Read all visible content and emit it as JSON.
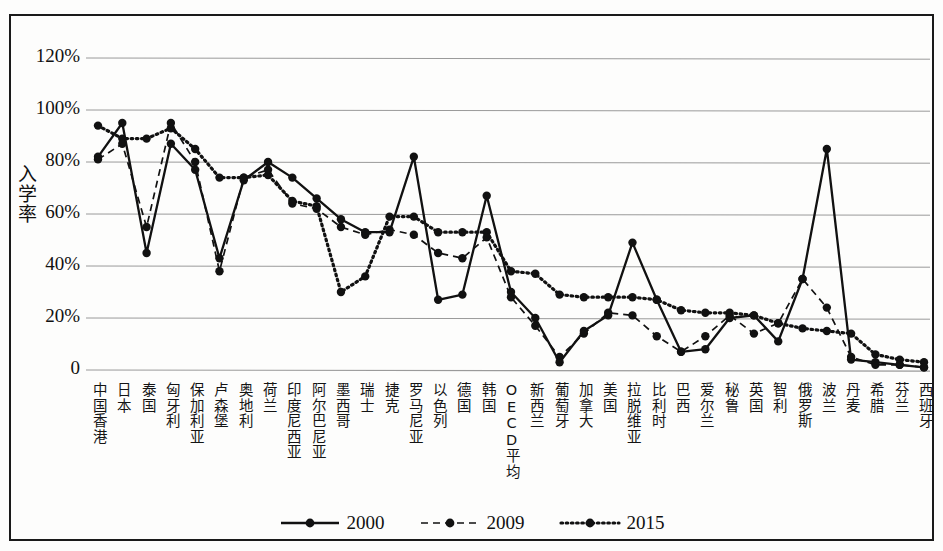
{
  "chart_data": {
    "type": "line",
    "title": "",
    "xlabel": "",
    "ylabel": "入学率",
    "ylim": [
      0,
      130
    ],
    "yticks": [
      0,
      20,
      40,
      60,
      80,
      100,
      120
    ],
    "ytick_labels": [
      "0",
      "20%",
      "40%",
      "60%",
      "80%",
      "100%",
      "120%"
    ],
    "grid": true,
    "legend_position": "bottom-center",
    "categories": [
      "中国香港",
      "日本",
      "泰国",
      "匈牙利",
      "保加利亚",
      "卢森堡",
      "奥地利",
      "荷兰",
      "印度尼西亚",
      "阿尔巴尼亚",
      "墨西哥",
      "瑞士",
      "捷克",
      "罗马尼亚",
      "以色列",
      "德国",
      "韩国",
      "OECD平均",
      "新西兰",
      "葡萄牙",
      "加拿大",
      "美国",
      "拉脱维亚",
      "比利时",
      "巴西",
      "爱尔兰",
      "秘鲁",
      "英国",
      "智利",
      "俄罗斯",
      "波兰",
      "丹麦",
      "希腊",
      "芬兰",
      "西班牙"
    ],
    "series": [
      {
        "name": "2000",
        "style": "solid",
        "values": [
          82,
          95,
          45,
          87,
          77,
          43,
          73,
          80,
          74,
          66,
          58,
          53,
          53,
          82,
          27,
          29,
          67,
          30,
          20,
          3,
          15,
          21,
          49,
          27,
          7,
          8,
          20,
          21,
          11,
          35,
          85,
          4,
          3,
          2,
          1
        ]
      },
      {
        "name": "2009",
        "style": "dashed",
        "values": [
          81,
          87,
          55,
          95,
          80,
          38,
          74,
          77,
          64,
          62,
          55,
          52,
          54,
          52,
          45,
          43,
          51,
          28,
          17,
          5,
          14,
          22,
          21,
          13,
          7,
          13,
          21,
          14,
          18,
          35,
          24,
          5,
          2,
          2,
          1
        ]
      },
      {
        "name": "2015",
        "style": "dotted",
        "values": [
          94,
          89,
          89,
          93,
          85,
          74,
          74,
          75,
          65,
          63,
          30,
          36,
          59,
          59,
          53,
          53,
          53,
          38,
          37,
          29,
          28,
          28,
          28,
          27,
          23,
          22,
          22,
          21,
          18,
          16,
          15,
          14,
          6,
          4,
          3
        ]
      }
    ],
    "legend": [
      {
        "label": "2000",
        "style": "solid"
      },
      {
        "label": "2009",
        "style": "dashed"
      },
      {
        "label": "2015",
        "style": "dotted"
      }
    ],
    "colors": {
      "line": "#111111",
      "marker": "#111111",
      "grid": "#9a9a9a",
      "frame": "#1a1a1a",
      "background": "#fdfdfc"
    }
  }
}
